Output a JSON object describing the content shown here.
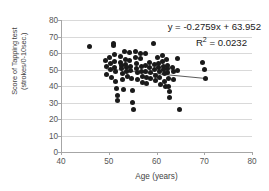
{
  "chart_data": {
    "type": "scatter",
    "title": "",
    "xlabel": "Age (years)",
    "ylabel": "Score of Tapping test\n(strokes/0-10sec.)",
    "xlim": [
      40,
      80
    ],
    "ylim": [
      0,
      80
    ],
    "xticks": [
      40,
      50,
      60,
      70,
      80
    ],
    "yticks": [
      0,
      10,
      20,
      30,
      40,
      50,
      60,
      70,
      80
    ],
    "grid": "horizontal",
    "legend": "none",
    "annotations": {
      "equation": "y = -0.2759x + 63.952",
      "r_squared_label": "R",
      "r_squared_exponent": "2",
      "r_squared_value": " = 0.0232"
    },
    "trendline": {
      "slope": -0.2759,
      "intercept": 63.952,
      "x_start": 49.5,
      "x_end": 70.2
    },
    "series": [
      {
        "name": "Tapping test score vs age",
        "marker": "circle",
        "color": "#1a1a1a",
        "points": [
          [
            45.9,
            64.0
          ],
          [
            49.4,
            55.5
          ],
          [
            49.5,
            52.0
          ],
          [
            49.6,
            47.0
          ],
          [
            50.2,
            57.5
          ],
          [
            50.3,
            53.5
          ],
          [
            50.4,
            50.0
          ],
          [
            50.5,
            45.0
          ],
          [
            50.9,
            66.0
          ],
          [
            51.0,
            64.5
          ],
          [
            51.1,
            59.0
          ],
          [
            51.2,
            55.0
          ],
          [
            51.3,
            51.5
          ],
          [
            51.4,
            48.5
          ],
          [
            51.5,
            43.0
          ],
          [
            51.6,
            38.5
          ],
          [
            51.8,
            34.0
          ],
          [
            51.9,
            31.0
          ],
          [
            52.4,
            58.0
          ],
          [
            52.5,
            54.5
          ],
          [
            52.6,
            52.5
          ],
          [
            52.7,
            50.5
          ],
          [
            52.8,
            47.5
          ],
          [
            52.9,
            44.0
          ],
          [
            53.0,
            38.0
          ],
          [
            53.4,
            61.0
          ],
          [
            53.5,
            56.0
          ],
          [
            53.6,
            53.0
          ],
          [
            53.7,
            51.0
          ],
          [
            53.8,
            49.0
          ],
          [
            53.9,
            46.0
          ],
          [
            54.3,
            60.5
          ],
          [
            54.4,
            55.5
          ],
          [
            54.5,
            52.0
          ],
          [
            54.6,
            49.5
          ],
          [
            54.7,
            44.5
          ],
          [
            54.9,
            37.5
          ],
          [
            55.0,
            30.0
          ],
          [
            55.1,
            25.5
          ],
          [
            55.6,
            61.0
          ],
          [
            55.7,
            57.0
          ],
          [
            55.8,
            53.5
          ],
          [
            55.9,
            50.5
          ],
          [
            56.0,
            48.0
          ],
          [
            56.1,
            44.0
          ],
          [
            56.6,
            59.5
          ],
          [
            56.7,
            56.5
          ],
          [
            56.8,
            52.0
          ],
          [
            56.9,
            48.5
          ],
          [
            57.0,
            45.5
          ],
          [
            57.1,
            42.0
          ],
          [
            57.6,
            60.0
          ],
          [
            57.7,
            52.5
          ],
          [
            57.8,
            49.0
          ],
          [
            57.9,
            45.0
          ],
          [
            58.0,
            41.5
          ],
          [
            58.5,
            54.0
          ],
          [
            58.6,
            51.5
          ],
          [
            58.7,
            48.0
          ],
          [
            58.8,
            44.5
          ],
          [
            59.4,
            65.5
          ],
          [
            59.5,
            53.0
          ],
          [
            59.6,
            50.0
          ],
          [
            59.7,
            46.5
          ],
          [
            59.8,
            43.5
          ],
          [
            60.3,
            57.0
          ],
          [
            60.4,
            53.5
          ],
          [
            60.5,
            51.0
          ],
          [
            60.6,
            48.5
          ],
          [
            60.7,
            45.0
          ],
          [
            60.8,
            41.0
          ],
          [
            61.2,
            58.5
          ],
          [
            61.3,
            55.0
          ],
          [
            61.4,
            52.0
          ],
          [
            61.5,
            50.0
          ],
          [
            61.6,
            47.5
          ],
          [
            61.7,
            43.0
          ],
          [
            61.8,
            39.5
          ],
          [
            62.1,
            56.0
          ],
          [
            62.2,
            52.5
          ],
          [
            62.3,
            50.5
          ],
          [
            62.4,
            48.0
          ],
          [
            62.5,
            44.5
          ],
          [
            62.6,
            40.0
          ],
          [
            62.7,
            36.5
          ],
          [
            62.8,
            33.0
          ],
          [
            63.4,
            51.5
          ],
          [
            63.5,
            48.5
          ],
          [
            63.6,
            44.0
          ],
          [
            64.4,
            56.5
          ],
          [
            64.5,
            49.5
          ],
          [
            64.9,
            25.5
          ],
          [
            69.6,
            54.5
          ],
          [
            70.0,
            50.0
          ],
          [
            70.2,
            44.5
          ]
        ]
      }
    ]
  }
}
